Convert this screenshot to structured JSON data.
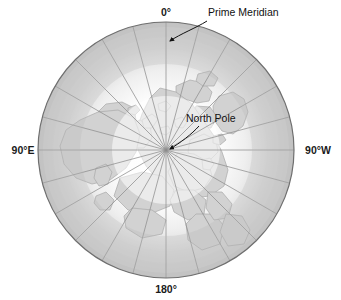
{
  "figure": {
    "title_visible": false,
    "projection": "polar-azimuthal-north",
    "background_color": "#ffffff"
  },
  "colors": {
    "ocean_low_latitude": "#c3c3c3",
    "ocean_mid": "#d8d8d8",
    "ice_and_inner": "#fbfbfb",
    "landmass": "#d2d2d2",
    "land_outline": "#a8a8a8",
    "graticule": "#8d8d8d",
    "outer_circle": "#6f6f6f",
    "label_text": "#1a1a1a",
    "leader_line": "#111111"
  },
  "globe": {
    "center_x": 166,
    "center_y": 150,
    "radius": 128,
    "graticule_meridian_interval_degrees": 15,
    "meridian_count": 24,
    "latitude_circles": [
      1
    ]
  },
  "edge_labels": [
    {
      "name": "prime-meridian-degree",
      "text": "0°",
      "x": 166,
      "y": 16,
      "anchor": "middle"
    },
    {
      "name": "ninety-east",
      "text": "90°E",
      "x": 23,
      "y": 154,
      "anchor": "middle"
    },
    {
      "name": "ninety-west",
      "text": "90°W",
      "x": 318,
      "y": 154,
      "anchor": "middle"
    },
    {
      "name": "one-eighty",
      "text": "180°",
      "x": 166,
      "y": 293,
      "anchor": "middle"
    }
  ],
  "callouts": [
    {
      "name": "prime-meridian",
      "text": "Prime Meridian",
      "label_x": 208,
      "label_y": 16,
      "anchor": "start",
      "leader_path": "M 207 21 C 196 28, 180 34, 170 41",
      "arrow_x": 167,
      "arrow_y": 42,
      "arrow_rotation": 205
    },
    {
      "name": "north-pole",
      "text": "North Pole",
      "label_x": 186,
      "label_y": 122,
      "anchor": "start",
      "leader_path": "M 199 126 C 192 134, 180 143, 170 149",
      "arrow_x": 167,
      "arrow_y": 150,
      "arrow_rotation": 209
    }
  ]
}
